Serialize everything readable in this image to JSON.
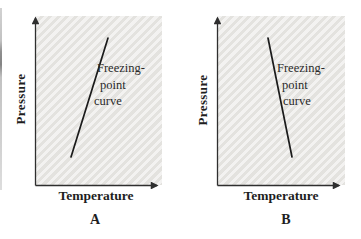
{
  "colors": {
    "background": "#ffffff",
    "plot_area_bg": "#e9e8e5",
    "axis": "#2f2f2f",
    "curve": "#1b1b1b",
    "text": "#1e1e1e"
  },
  "panels": [
    {
      "letter": "A",
      "y_axis_label": "Pressure",
      "x_axis_label": "Temperature",
      "curve_label": [
        "Freezing-",
        "point",
        "curve"
      ],
      "curve_slope": "positive"
    },
    {
      "letter": "B",
      "y_axis_label": "Pressure",
      "x_axis_label": "Temperature",
      "curve_label": [
        "Freezing-",
        "point",
        "curve"
      ],
      "curve_slope": "negative"
    }
  ]
}
